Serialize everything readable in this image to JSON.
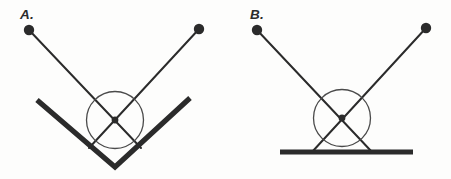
{
  "figure": {
    "background_color": "#fdfdfc",
    "ink_color": "#2b2b2b",
    "circle_stroke_color": "#4a4a4a",
    "panel_count": 2
  },
  "panels": [
    {
      "id": "panel-a",
      "label": "A.",
      "label_pos": {
        "x": 20,
        "y": 19
      },
      "description": "Two bobs on rods meeting at a crossing point inside a circle, resting in a V-shaped trough",
      "bobs": [
        {
          "name": "left-bob",
          "cx": 29,
          "cy": 30,
          "r": 5.2
        },
        {
          "name": "right-bob",
          "cx": 199,
          "cy": 29,
          "r": 5.2
        }
      ],
      "rods": [
        {
          "name": "left-rod",
          "x1": 29,
          "y1": 30,
          "x2": 141,
          "y2": 148
        },
        {
          "name": "right-rod",
          "x1": 199,
          "y1": 29,
          "x2": 89,
          "y2": 148
        }
      ],
      "crossing_point": {
        "x": 115,
        "y": 120,
        "r": 3.4
      },
      "circle": {
        "cx": 115,
        "cy": 120,
        "r": 28.5
      },
      "support": {
        "type": "v-track",
        "name": "v-track",
        "points": [
          {
            "x": 37,
            "y": 100
          },
          {
            "x": 115,
            "y": 167
          },
          {
            "x": 190,
            "y": 98
          }
        ],
        "stroke_width": 5.2
      }
    },
    {
      "id": "panel-b",
      "label": "B.",
      "label_pos": {
        "x": 250,
        "y": 19
      },
      "description": "Two bobs on rods meeting at a crossing point inside a circle, resting on flat horizontal ground",
      "bobs": [
        {
          "name": "left-bob",
          "cx": 257,
          "cy": 30,
          "r": 5.2
        },
        {
          "name": "right-bob",
          "cx": 426,
          "cy": 28,
          "r": 5.2
        }
      ],
      "rods": [
        {
          "name": "left-rod",
          "x1": 257,
          "y1": 30,
          "x2": 372,
          "y2": 152
        },
        {
          "name": "right-rod",
          "x1": 426,
          "y1": 28,
          "x2": 312,
          "y2": 152
        }
      ],
      "crossing_point": {
        "x": 342,
        "y": 118,
        "r": 3.4
      },
      "circle": {
        "cx": 342,
        "cy": 118,
        "r": 28.5
      },
      "support": {
        "type": "ground-line",
        "name": "ground-line",
        "points": [
          {
            "x": 280,
            "y": 152
          },
          {
            "x": 413,
            "y": 152
          }
        ],
        "stroke_width": 5.2
      }
    }
  ],
  "style": {
    "rod_stroke_width": 2.0,
    "circle_stroke_width": 1.3
  }
}
